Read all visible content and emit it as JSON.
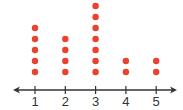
{
  "chart_data": {
    "type": "scatter",
    "subtype": "dot_plot",
    "title": "",
    "xlabel": "",
    "ylabel": "",
    "categories": [
      "1",
      "2",
      "3",
      "4",
      "5"
    ],
    "x": [
      1,
      2,
      3,
      4,
      5
    ],
    "values": [
      5,
      4,
      7,
      2,
      2
    ],
    "xlim": [
      0.6,
      5.5
    ],
    "grid": false,
    "legend": null,
    "colors": {
      "dot": "#e8432f",
      "axis": "#333333"
    }
  }
}
